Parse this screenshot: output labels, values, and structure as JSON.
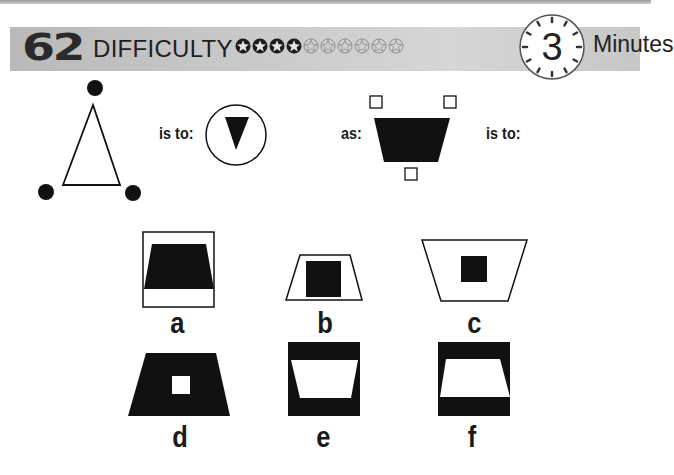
{
  "header": {
    "puzzle_number": "62",
    "difficulty_label": "DIFFICULTY",
    "difficulty_filled": 4,
    "difficulty_total": 10,
    "timer_value": "3",
    "timer_unit": "Minutes"
  },
  "question": {
    "is_to_1": "is to:",
    "as": "as:",
    "is_to_2": "is to:"
  },
  "options": [
    {
      "id": "a",
      "label": "a"
    },
    {
      "id": "b",
      "label": "b"
    },
    {
      "id": "c",
      "label": "c"
    },
    {
      "id": "d",
      "label": "d"
    },
    {
      "id": "e",
      "label": "e"
    },
    {
      "id": "f",
      "label": "f"
    }
  ],
  "colors": {
    "ink": "#111111",
    "header_bg": "#c8c8c8"
  }
}
